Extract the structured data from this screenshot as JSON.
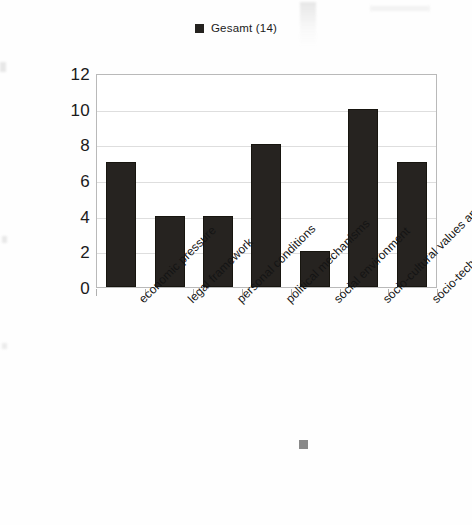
{
  "legend": {
    "swatch_name": "legend-color-swatch",
    "label": "Gesamt (14)",
    "color": "#262320"
  },
  "axes": {
    "y_ticks": [
      "0",
      "2",
      "4",
      "6",
      "8",
      "10",
      "12"
    ],
    "y_min": 0,
    "y_max": 12
  },
  "chart_data": {
    "type": "bar",
    "title": "",
    "subtitle": "",
    "xlabel": "",
    "ylabel": "",
    "ylim": [
      0,
      12
    ],
    "ytick_values": [
      0,
      2,
      4,
      6,
      8,
      10,
      12
    ],
    "grid": true,
    "legend_position": "top-center",
    "bar_color": "#262320",
    "categories": [
      "economic pressure",
      "legal framework",
      "personal conditions",
      "political mechanisms",
      "social environment",
      "socio-cultural values and practices",
      "socio-technological change"
    ],
    "series": [
      {
        "name": "Gesamt (14)",
        "values": [
          7,
          4,
          4,
          8,
          2,
          10,
          7
        ]
      }
    ]
  }
}
